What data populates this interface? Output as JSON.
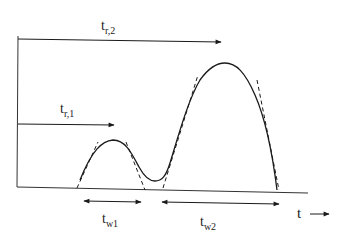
{
  "diagram": {
    "type": "pulse-timing",
    "axis": {
      "x_label": "t",
      "x_arrow": "→"
    },
    "labels": {
      "tr2_main": "t",
      "tr2_sub": "r,2",
      "tr1_main": "t",
      "tr1_sub": "r,1",
      "tw1_main": "t",
      "tw1_sub": "w1",
      "tw2_main": "t",
      "tw2_sub": "w2"
    },
    "peaks": [
      {
        "name": "peak-1",
        "description": "small peak",
        "width_label": "tw1",
        "retention_label": "tr,1"
      },
      {
        "name": "peak-2",
        "description": "large peak",
        "width_label": "tw2",
        "retention_label": "tr,2"
      }
    ],
    "colors": {
      "stroke": "#1a1a1a",
      "background": "#ffffff"
    }
  }
}
